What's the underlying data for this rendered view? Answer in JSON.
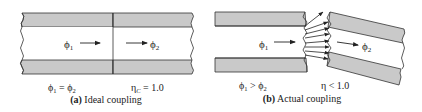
{
  "colors": {
    "cladding_fill": "#c9c9c9",
    "core_fill": "#ffffff",
    "line": "#333333",
    "text": "#222222"
  },
  "panel_a": {
    "flux_in": "ϕ",
    "flux_in_sub": "1",
    "flux_out": "ϕ",
    "flux_out_sub": "2",
    "relation_left": "ϕ",
    "relation_left_sub": "1",
    "relation_op": " = ϕ",
    "relation_right_sub": "2",
    "efficiency_symbol": "η",
    "efficiency_sub": "C",
    "efficiency_value": " = 1.0",
    "caption_letter": "(a)",
    "caption_text": " Ideal coupling"
  },
  "panel_b": {
    "flux_in": "ϕ",
    "flux_in_sub": "1",
    "flux_out": "ϕ",
    "flux_out_sub": "2",
    "relation_left": "ϕ",
    "relation_left_sub": "1",
    "relation_op": " > ϕ",
    "relation_right_sub": "2",
    "efficiency_text": "η < 1.0",
    "caption_letter": "(b)",
    "caption_text": " Actual coupling"
  }
}
